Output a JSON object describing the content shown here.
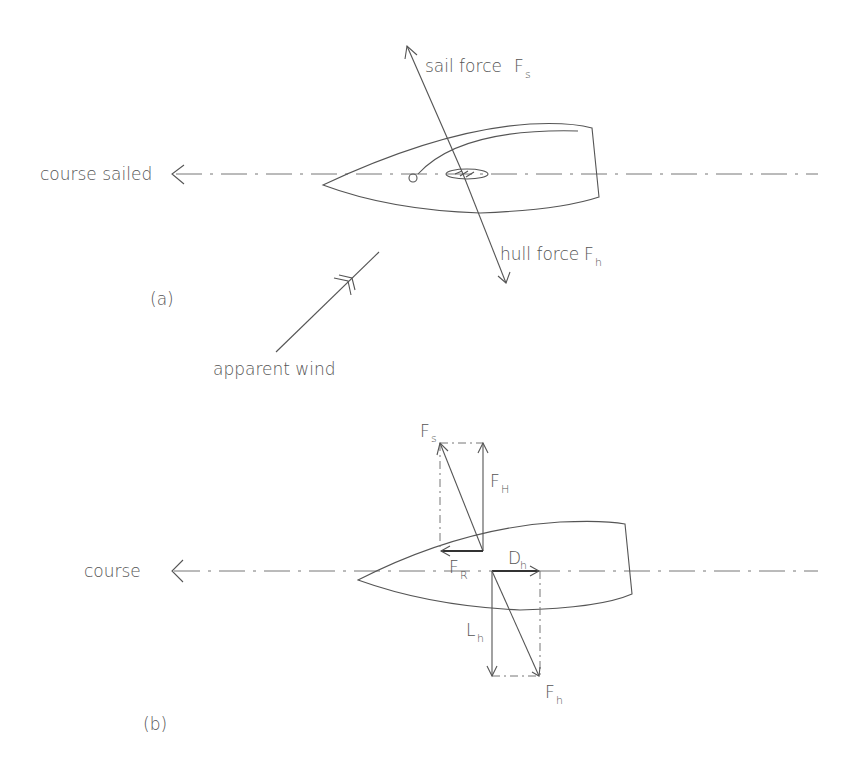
{
  "diagram": {
    "part_a": {
      "label": "(a)",
      "course_label": "course sailed",
      "sail_force_label": "sail force",
      "sail_force_symbol": "F",
      "sail_force_subscript": "s",
      "hull_force_label": "hull force",
      "hull_force_symbol": "F",
      "hull_force_subscript": "h",
      "wind_label": "apparent wind"
    },
    "part_b": {
      "label": "(b)",
      "course_label": "course",
      "vectors": [
        {
          "symbol": "F",
          "subscript": "s",
          "meaning": "sail force"
        },
        {
          "symbol": "F",
          "subscript": "H",
          "meaning": "heeling force"
        },
        {
          "symbol": "F",
          "subscript": "R",
          "meaning": "driving force"
        },
        {
          "symbol": "D",
          "subscript": "h",
          "meaning": "hull drag"
        },
        {
          "symbol": "L",
          "subscript": "h",
          "meaning": "hull lift"
        },
        {
          "symbol": "F",
          "subscript": "h",
          "meaning": "hull force"
        }
      ]
    },
    "colors": {
      "line": "#555555",
      "text": "#555555",
      "background": "#ffffff"
    }
  }
}
